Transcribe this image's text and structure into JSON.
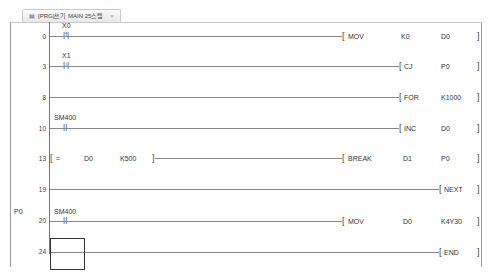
{
  "tab": {
    "icon": "program-icon",
    "title": "[PRG]쓰기 MAIN 25스텝",
    "close": "×"
  },
  "rungs": [
    {
      "step": "0",
      "contact": "X0",
      "contact_type": "rising-edge",
      "instruction": "MOV",
      "operands": [
        "K0",
        "D0"
      ]
    },
    {
      "step": "3",
      "contact": "X1",
      "contact_type": "falling-edge",
      "instruction": "CJ",
      "operands": [
        "P0"
      ]
    },
    {
      "step": "8",
      "contact": "",
      "instruction": "FOR",
      "operands": [
        "K1000"
      ]
    },
    {
      "step": "10",
      "contact": "SM400",
      "contact_type": "normally-open",
      "instruction": "INC",
      "operands": [
        "D0"
      ]
    },
    {
      "step": "13",
      "compare": {
        "op": "=",
        "a": "D0",
        "b": "K500"
      },
      "instruction": "BREAK",
      "operands": [
        "D1",
        "P0"
      ]
    },
    {
      "step": "19",
      "contact": "",
      "instruction": "NEXT",
      "operands": []
    },
    {
      "step": "20",
      "pointer": "P0",
      "contact": "SM400",
      "contact_type": "normally-open",
      "instruction": "MOV",
      "operands": [
        "D0",
        "K4Y30"
      ]
    },
    {
      "step": "24",
      "contact": "",
      "instruction": "END",
      "operands": []
    }
  ]
}
